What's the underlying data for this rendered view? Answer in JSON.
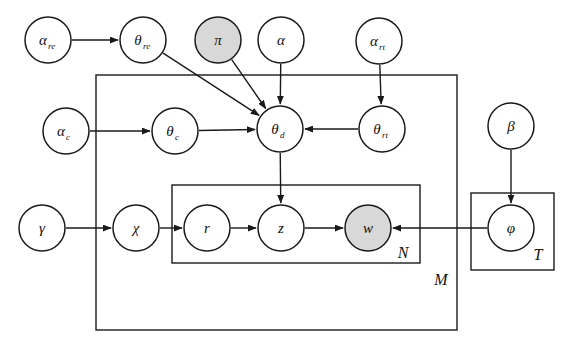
{
  "diagram": {
    "type": "plate-notation-graphical-model",
    "title": "",
    "canvas": {
      "width": 572,
      "height": 354
    },
    "colors": {
      "stroke": "#1a1a1a",
      "node_fill": "#ffffff",
      "observed_fill": "#d8d8d8",
      "background": "#ffffff"
    },
    "nodes": [
      {
        "id": "alpha_re",
        "label": "α",
        "subscript": "re",
        "cx": 48,
        "cy": 40,
        "r": 23,
        "shaded": false
      },
      {
        "id": "theta_re",
        "label": "θ",
        "subscript": "re",
        "cx": 143,
        "cy": 40,
        "r": 23,
        "shaded": false
      },
      {
        "id": "pi",
        "label": "π",
        "subscript": "",
        "cx": 218,
        "cy": 40,
        "r": 23,
        "shaded": true
      },
      {
        "id": "alpha",
        "label": "α",
        "subscript": "",
        "cx": 281,
        "cy": 40,
        "r": 23,
        "shaded": false
      },
      {
        "id": "alpha_rt",
        "label": "α",
        "subscript": "rt",
        "cx": 379,
        "cy": 41,
        "r": 23,
        "shaded": false
      },
      {
        "id": "alpha_c",
        "label": "α",
        "subscript": "c",
        "cx": 66,
        "cy": 131,
        "r": 23,
        "shaded": false
      },
      {
        "id": "theta_c",
        "label": "θ",
        "subscript": "c",
        "cx": 175,
        "cy": 131,
        "r": 23,
        "shaded": false
      },
      {
        "id": "theta_d",
        "label": "θ",
        "subscript": "d",
        "cx": 280,
        "cy": 129,
        "r": 23,
        "shaded": false
      },
      {
        "id": "theta_rt",
        "label": "θ",
        "subscript": "rt",
        "cx": 382,
        "cy": 129,
        "r": 23,
        "shaded": false
      },
      {
        "id": "beta",
        "label": "β",
        "subscript": "",
        "cx": 511,
        "cy": 126,
        "r": 23,
        "shaded": false
      },
      {
        "id": "gamma",
        "label": "γ",
        "subscript": "",
        "cx": 42,
        "cy": 228,
        "r": 23,
        "shaded": false
      },
      {
        "id": "chi",
        "label": "χ",
        "subscript": "",
        "cx": 136,
        "cy": 228,
        "r": 23,
        "shaded": false
      },
      {
        "id": "r",
        "label": "r",
        "subscript": "",
        "cx": 207,
        "cy": 228,
        "r": 23,
        "shaded": false
      },
      {
        "id": "z",
        "label": "z",
        "subscript": "",
        "cx": 281,
        "cy": 228,
        "r": 23,
        "shaded": false
      },
      {
        "id": "w",
        "label": "w",
        "subscript": "",
        "cx": 368,
        "cy": 228,
        "r": 23,
        "shaded": true
      },
      {
        "id": "phi",
        "label": "φ",
        "subscript": "",
        "cx": 511,
        "cy": 228,
        "r": 23,
        "shaded": false
      }
    ],
    "edges": [
      {
        "from": "alpha_re",
        "to": "theta_re"
      },
      {
        "from": "theta_re",
        "to": "theta_d"
      },
      {
        "from": "pi",
        "to": "theta_d"
      },
      {
        "from": "alpha",
        "to": "theta_d"
      },
      {
        "from": "alpha_c",
        "to": "theta_c"
      },
      {
        "from": "theta_c",
        "to": "theta_d"
      },
      {
        "from": "alpha_rt",
        "to": "theta_rt"
      },
      {
        "from": "theta_rt",
        "to": "theta_d"
      },
      {
        "from": "theta_d",
        "to": "z"
      },
      {
        "from": "gamma",
        "to": "chi"
      },
      {
        "from": "chi",
        "to": "r"
      },
      {
        "from": "r",
        "to": "z"
      },
      {
        "from": "z",
        "to": "w"
      },
      {
        "from": "beta",
        "to": "phi"
      },
      {
        "from": "phi",
        "to": "w"
      }
    ],
    "plates": [
      {
        "id": "plate_M",
        "label": "M",
        "x": 96,
        "y": 75,
        "width": 361,
        "height": 255,
        "label_x": 441,
        "label_y": 279
      },
      {
        "id": "plate_N",
        "label": "N",
        "x": 172,
        "y": 185,
        "width": 248,
        "height": 78,
        "label_x": 403,
        "label_y": 252
      },
      {
        "id": "plate_T",
        "label": "T",
        "x": 471,
        "y": 193,
        "width": 83,
        "height": 77,
        "label_x": 538,
        "label_y": 254
      }
    ]
  }
}
